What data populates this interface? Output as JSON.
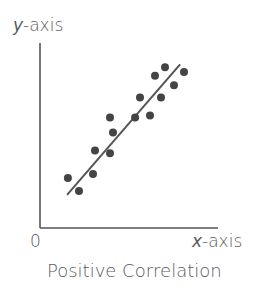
{
  "chart_data": {
    "type": "scatter",
    "title": "Positive Correlation",
    "xlabel": "x-axis",
    "ylabel": "y-axis",
    "origin_label": "0",
    "grid": false,
    "legend": null,
    "xlim": [
      0,
      10
    ],
    "ylim": [
      0,
      10
    ],
    "points": [
      {
        "x": 1.57,
        "y": 2.86
      },
      {
        "x": 2.19,
        "y": 2.11
      },
      {
        "x": 2.98,
        "y": 3.08
      },
      {
        "x": 3.09,
        "y": 4.43
      },
      {
        "x": 3.93,
        "y": 4.27
      },
      {
        "x": 4.1,
        "y": 5.46
      },
      {
        "x": 3.93,
        "y": 6.32
      },
      {
        "x": 5.34,
        "y": 6.32
      },
      {
        "x": 6.18,
        "y": 6.43
      },
      {
        "x": 5.62,
        "y": 7.46
      },
      {
        "x": 6.8,
        "y": 7.46
      },
      {
        "x": 6.46,
        "y": 8.7
      },
      {
        "x": 7.02,
        "y": 9.19
      },
      {
        "x": 7.53,
        "y": 8.16
      },
      {
        "x": 8.09,
        "y": 8.92
      }
    ],
    "trend_line": {
      "x1": 1.52,
      "y1": 1.89,
      "x2": 7.87,
      "y2": 9.35
    },
    "colors": {
      "points": "#444444",
      "line": "#555555",
      "axes": "#555555",
      "text": "#5a5a5a"
    }
  },
  "labels": {
    "y_axis": {
      "var": "y",
      "rest": "-axis"
    },
    "x_axis": {
      "var": "x",
      "rest": "-axis"
    },
    "origin": "0",
    "title": "Positive Correlation"
  }
}
